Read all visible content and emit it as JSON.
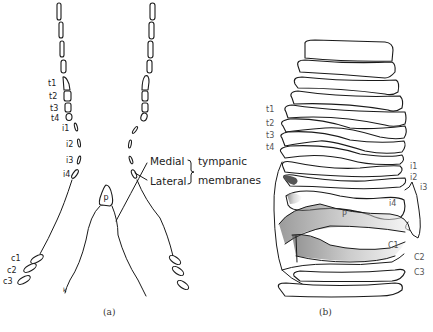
{
  "figure": {
    "panel_a": {
      "caption": "(a)",
      "left_labels": {
        "t1": "t1",
        "t2": "t2",
        "t3": "t3",
        "t4": "t4",
        "i1": "i1",
        "i2": "i2",
        "i3": "i3",
        "i4": "i4",
        "c1": "c1",
        "c2": "c2",
        "c3": "c3"
      },
      "p_label": "p",
      "k_label": "k",
      "medial": "Medial",
      "lateral": "Lateral",
      "tympanic": "tympanic",
      "membranes": "membranes"
    },
    "panel_b": {
      "caption": "(b)",
      "left_labels": {
        "t1": "t1",
        "t2": "t2",
        "t3": "t3",
        "t4": "t4"
      },
      "right_labels": {
        "i1": "i1",
        "i2": "i2",
        "i3": "i3",
        "i4": "i4",
        "p": "P",
        "c1": "C1",
        "c2": "C2",
        "c3": "C3"
      }
    },
    "colors": {
      "ink": "#1a1a1a",
      "stipple": "#7a7a7a",
      "background": "#ffffff"
    }
  }
}
